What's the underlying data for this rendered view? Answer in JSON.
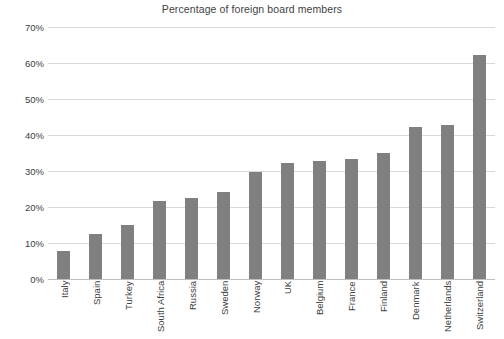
{
  "chart_data": {
    "type": "bar",
    "title": "Percentage of foreign board members",
    "xlabel": "",
    "ylabel": "",
    "ylim": [
      0,
      70
    ],
    "ytick_values": [
      0,
      10,
      20,
      30,
      40,
      50,
      60,
      70
    ],
    "ytick_labels": [
      "0%",
      "10%",
      "20%",
      "30%",
      "40%",
      "50%",
      "60%",
      "70%"
    ],
    "grid": true,
    "legend": false,
    "bar_color": "#808080",
    "gridline_color": "#d9d9d9",
    "categories": [
      "Italy",
      "Spain",
      "Turkey",
      "South Africa",
      "Russia",
      "Sweden",
      "Norway",
      "UK",
      "Belgium",
      "France",
      "Finland",
      "Denmark",
      "Netherlands",
      "Switzerland"
    ],
    "values": [
      7.7,
      12.5,
      15.1,
      21.7,
      22.6,
      24.2,
      29.6,
      32.2,
      32.8,
      33.3,
      35.1,
      42.2,
      42.8,
      62.1
    ]
  }
}
